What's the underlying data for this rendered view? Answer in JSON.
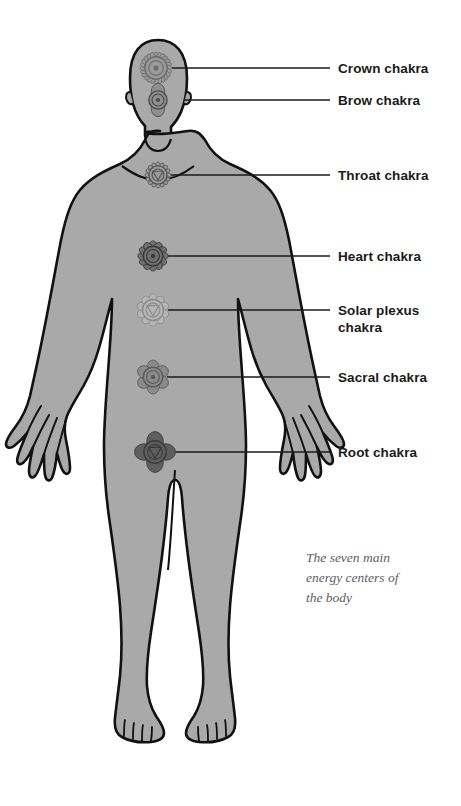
{
  "figure": {
    "caption": "The seven main\nenergy centers of\nthe body",
    "colors": {
      "body_fill": "#a9a9a9",
      "body_outline": "#111111",
      "background": "#ffffff",
      "leader_line": "#1a1a1a",
      "label_text": "#1a1a1a",
      "caption_text": "#5d5d63"
    }
  },
  "chakras": [
    {
      "id": "crown",
      "label": "Crown chakra",
      "symbol_name": "crown-chakra-lotus-icon",
      "petals": 24,
      "symbol_fill": "#9a9a9a",
      "symbol_stroke": "#6d6d6d",
      "symbol_cx": 156,
      "symbol_cy": 68,
      "symbol_r": 16,
      "line_y": 68,
      "line_x1": 172,
      "line_x2": 330,
      "label_x": 338,
      "label_y": 60
    },
    {
      "id": "brow",
      "label": "Brow chakra",
      "symbol_name": "brow-chakra-two-petal-icon",
      "petals": 2,
      "symbol_fill": "#8f8f8f",
      "symbol_stroke": "#4a4a4a",
      "symbol_cx": 158,
      "symbol_cy": 100,
      "symbol_r": 13,
      "line_y": 100,
      "line_x1": 184,
      "line_x2": 330,
      "label_x": 338,
      "label_y": 92
    },
    {
      "id": "throat",
      "label": "Throat chakra",
      "symbol_name": "throat-chakra-triangle-icon",
      "petals": 16,
      "symbol_fill": "#9c9c9c",
      "symbol_stroke": "#545454",
      "symbol_cx": 158,
      "symbol_cy": 175,
      "symbol_r": 13,
      "line_y": 175,
      "line_x1": 171,
      "line_x2": 330,
      "label_x": 338,
      "label_y": 167
    },
    {
      "id": "heart",
      "label": "Heart chakra",
      "symbol_name": "heart-chakra-lotus-icon",
      "petals": 12,
      "symbol_fill": "#6f6f6f",
      "symbol_stroke": "#3a3a3a",
      "symbol_cx": 153,
      "symbol_cy": 256,
      "symbol_r": 14,
      "line_y": 256,
      "line_x1": 167,
      "line_x2": 330,
      "label_x": 338,
      "label_y": 248
    },
    {
      "id": "solar-plexus",
      "label": "Solar plexus\nchakra",
      "symbol_name": "solar-plexus-chakra-lotus-icon",
      "petals": 10,
      "symbol_fill": "#b6b6b6",
      "symbol_stroke": "#8a8a8a",
      "symbol_cx": 153,
      "symbol_cy": 310,
      "symbol_r": 15,
      "line_y": 310,
      "line_x1": 168,
      "line_x2": 330,
      "label_x": 338,
      "label_y": 302
    },
    {
      "id": "sacral",
      "label": "Sacral chakra",
      "symbol_name": "sacral-chakra-lotus-icon",
      "petals": 6,
      "symbol_fill": "#8a8a8a",
      "symbol_stroke": "#5a5a5a",
      "symbol_cx": 153,
      "symbol_cy": 377,
      "symbol_r": 14,
      "line_y": 377,
      "line_x1": 167,
      "line_x2": 330,
      "label_x": 338,
      "label_y": 369
    },
    {
      "id": "root",
      "label": "Root chakra",
      "symbol_name": "root-chakra-lotus-icon",
      "petals": 4,
      "symbol_fill": "#5e5e5e",
      "symbol_stroke": "#3a3a3a",
      "symbol_cx": 155,
      "symbol_cy": 452,
      "symbol_r": 16,
      "line_y": 452,
      "line_x1": 171,
      "line_x2": 330,
      "label_x": 338,
      "label_y": 444
    }
  ],
  "caption_block": {
    "x": 306,
    "y": 548
  }
}
